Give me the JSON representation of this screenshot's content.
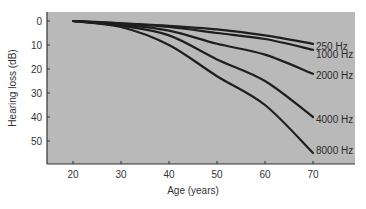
{
  "chart_data": {
    "type": "line",
    "title": "",
    "xlabel": "Age (years)",
    "ylabel": "Hearing loss (dB)",
    "x": [
      20,
      30,
      40,
      50,
      60,
      70
    ],
    "xticks": [
      20,
      30,
      40,
      50,
      60,
      70
    ],
    "yticks": [
      0,
      10,
      20,
      30,
      40,
      50
    ],
    "xlim": [
      15,
      79
    ],
    "ylim": [
      -3.7,
      59.5
    ],
    "y_inverted": true,
    "grid": false,
    "legend_position": "inline-right",
    "series": [
      {
        "name": "250 Hz",
        "values": [
          0,
          1,
          2,
          3.5,
          6,
          9.5
        ]
      },
      {
        "name": "1000 Hz",
        "values": [
          0,
          1,
          2.5,
          5,
          7.5,
          12
        ]
      },
      {
        "name": "2000 Hz",
        "values": [
          0,
          1.5,
          4,
          9.5,
          14,
          22
        ]
      },
      {
        "name": "4000 Hz",
        "values": [
          0,
          2,
          6,
          16,
          25,
          40
        ]
      },
      {
        "name": "8000 Hz",
        "values": [
          0,
          2.5,
          10,
          23,
          35,
          55
        ]
      }
    ]
  },
  "colors": {
    "plot_background": "#b9b9b9",
    "line": "#1e1e1e",
    "axis": "#333333"
  },
  "series_label_y": [
    46,
    54,
    75,
    119,
    150
  ]
}
